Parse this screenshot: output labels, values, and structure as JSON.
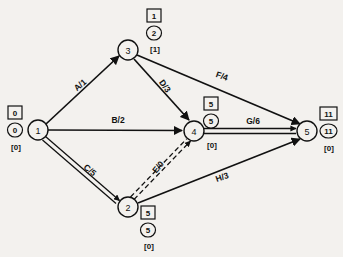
{
  "diagram": {
    "background_color": "#f3f1ee",
    "line_color": "#111111",
    "nodes": [
      {
        "id": "1",
        "label": "1",
        "cx": 38,
        "cy": 130,
        "r": 10,
        "tags": {
          "square": "0",
          "circle": "0",
          "bracket": "[0]"
        },
        "tag_x": 15,
        "tag_top_y": 113,
        "tag_mid_y": 130,
        "tag_bot_y": 147
      },
      {
        "id": "2",
        "label": "2",
        "cx": 128,
        "cy": 207,
        "r": 10,
        "tags": {
          "square": "5",
          "circle": "5",
          "bracket": "[0]"
        },
        "tag_x": 148,
        "tag_top_y": 213,
        "tag_mid_y": 230,
        "tag_bot_y": 246
      },
      {
        "id": "3",
        "label": "3",
        "cx": 128,
        "cy": 50,
        "r": 10,
        "tags": {
          "square": "1",
          "circle": "2",
          "bracket": "[1]"
        },
        "tag_x": 154,
        "tag_top_y": 16,
        "tag_mid_y": 33,
        "tag_bot_y": 49
      },
      {
        "id": "4",
        "label": "4",
        "cx": 194,
        "cy": 131,
        "r": 10,
        "tags": {
          "square": "5",
          "circle": "5",
          "bracket": "[0]"
        },
        "tag_x": 211,
        "tag_top_y": 104,
        "tag_mid_y": 121,
        "tag_bot_y": 145
      },
      {
        "id": "5",
        "label": "5",
        "cx": 307,
        "cy": 131,
        "r": 10,
        "tags": {
          "square": "11",
          "circle": "11",
          "bracket": "[0]"
        },
        "tag_x": 329,
        "tag_top_y": 114,
        "tag_mid_y": 131,
        "tag_bot_y": 148
      }
    ],
    "edges": [
      {
        "id": "A",
        "label": "A/1",
        "from": "1",
        "to": "3",
        "style": "single",
        "label_x": 80,
        "label_y": 85,
        "label_rotation": -41
      },
      {
        "id": "B",
        "label": "B/2",
        "from": "1",
        "to": "4",
        "style": "single",
        "label_x": 118,
        "label_y": 120,
        "label_rotation": 0
      },
      {
        "id": "C",
        "label": "C/5",
        "from": "1",
        "to": "2",
        "style": "double",
        "label_x": 90,
        "label_y": 170,
        "label_rotation": 41
      },
      {
        "id": "D",
        "label": "D/3",
        "from": "3",
        "to": "4",
        "style": "single",
        "label_x": 165,
        "label_y": 86,
        "label_rotation": 55
      },
      {
        "id": "E",
        "label": "E/0",
        "from": "2",
        "to": "4",
        "style": "dashed-double",
        "label_x": 158,
        "label_y": 167,
        "label_rotation": -50
      },
      {
        "id": "F",
        "label": "F/4",
        "from": "3",
        "to": "5",
        "style": "single",
        "label_x": 222,
        "label_y": 76,
        "label_rotation": 19
      },
      {
        "id": "G",
        "label": "G/6",
        "from": "4",
        "to": "5",
        "style": "double",
        "label_x": 253,
        "label_y": 121,
        "label_rotation": 0
      },
      {
        "id": "H",
        "label": "H/3",
        "from": "2",
        "to": "5",
        "style": "single",
        "label_x": 222,
        "label_y": 177,
        "label_rotation": -19
      }
    ]
  }
}
